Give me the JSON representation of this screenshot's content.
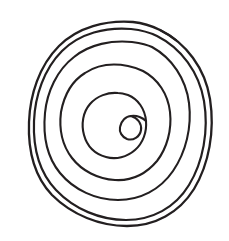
{
  "image": {
    "title": "Hand-drawn concentric spiral",
    "kind": "line-drawing",
    "width": 229,
    "height": 241,
    "background_color": "#ffffff",
    "ink_color": "#231f20",
    "stroke_width": 2.1,
    "technique": "freehand pen / ink contour",
    "description": "A freehand spiral of about four and a half concentric turns drawn in dark ink on plain white paper. The outermost turns nearly touch, and the spiral terminates at the centre in a small pear- or heart-shaped loop with a cusp on its right side."
  },
  "geometry": {
    "center": {
      "x": 118,
      "y": 123
    },
    "bounds": {
      "left": 28,
      "top": 21,
      "right": 211,
      "bottom": 226
    },
    "turn_count": 4.5,
    "turns": [
      {
        "name": "outer-turn-1",
        "rx": 90,
        "ry": 101,
        "note": "outermost, runs close beside turn 2 along the upper-left"
      },
      {
        "name": "outer-turn-2",
        "rx": 84,
        "ry": 95,
        "note": "paired with turn 1"
      },
      {
        "name": "middle-turn-3",
        "rx": 70,
        "ry": 79
      },
      {
        "name": "middle-turn-4",
        "rx": 51,
        "ry": 57
      },
      {
        "name": "inner-turn-5",
        "rx": 30,
        "ry": 33
      },
      {
        "name": "terminus-loop",
        "rx": 14,
        "ry": 15,
        "note": "small pear/heart loop with cusp on the right"
      }
    ],
    "midline_crossings_x": [
      29,
      33,
      47,
      66,
      92,
      135,
      166,
      190,
      208
    ],
    "midline_y": 122
  },
  "chart_data": {
    "type": "line",
    "xlabel": "",
    "ylabel": "",
    "series": [
      {
        "name": "spiral-path",
        "parameterization": "r = a + b*theta",
        "a": 9,
        "b": 14.2,
        "theta_start": 0,
        "theta_end": 28.3,
        "units": "pixels / radians"
      }
    ],
    "legend": "none",
    "grid": false
  }
}
